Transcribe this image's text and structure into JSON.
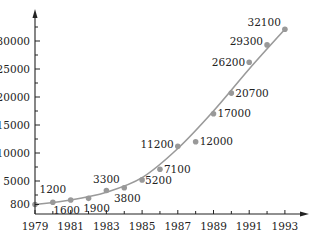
{
  "chart_data": {
    "type": "scatter",
    "title": "",
    "xlabel": "",
    "ylabel": "",
    "x_ticks": [
      1979,
      1981,
      1983,
      1985,
      1987,
      1989,
      1991,
      1993
    ],
    "y_ticks": [
      800,
      5000,
      10000,
      15000,
      20000,
      25000,
      30000
    ],
    "xlim": [
      1979,
      1994
    ],
    "ylim": [
      0,
      33500
    ],
    "grid": false,
    "legend": null,
    "trendline": "smooth exponential-like fitted curve",
    "series": [
      {
        "name": "data",
        "x": [
          1979,
          1980,
          1981,
          1982,
          1983,
          1984,
          1985,
          1986,
          1987,
          1988,
          1989,
          1990,
          1991,
          1992,
          1993
        ],
        "values": [
          800,
          1200,
          1600,
          1900,
          3300,
          3800,
          5200,
          7100,
          11200,
          12000,
          17000,
          20700,
          26200,
          29300,
          32100
        ],
        "labels": [
          "",
          "1200",
          "1600",
          "1900",
          "3300",
          "3800",
          "5200",
          "7100",
          "11200",
          "12000",
          "17000",
          "20700",
          "26200",
          "29300",
          "32100"
        ]
      }
    ]
  },
  "colors": {
    "axis": "#222222",
    "points": "#999999",
    "curve": "#9a9a9a",
    "text": "#222222"
  }
}
